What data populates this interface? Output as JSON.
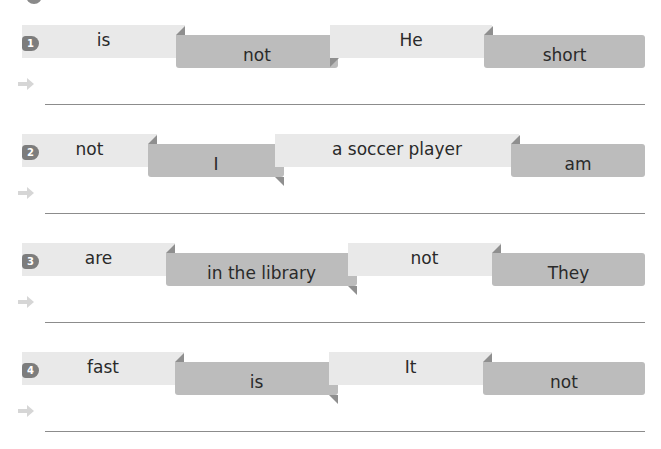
{
  "exercises": [
    {
      "number": "1",
      "words": [
        "is",
        "not",
        "He",
        "short"
      ]
    },
    {
      "number": "2",
      "words": [
        "not",
        "I",
        "a soccer player",
        "am"
      ]
    },
    {
      "number": "3",
      "words": [
        "are",
        "in the library",
        "not",
        "They"
      ]
    },
    {
      "number": "4",
      "words": [
        "fast",
        "is",
        "It",
        "not"
      ]
    }
  ],
  "colors": {
    "light_ribbon": "#e9e9e9",
    "dark_ribbon": "#bcbcbc",
    "badge": "#7d7d7d"
  }
}
